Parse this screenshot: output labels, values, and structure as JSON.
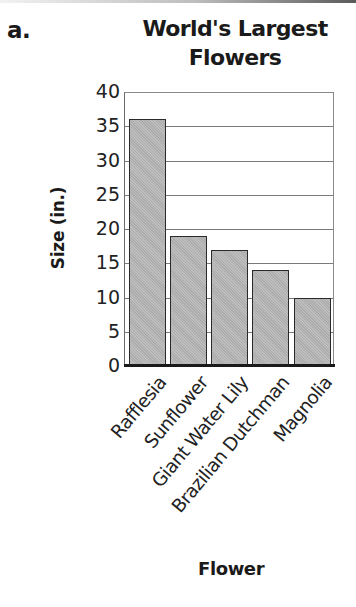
{
  "header": {
    "part_label": "a.",
    "title_line1": "World's Largest",
    "title_line2": "Flowers"
  },
  "axes": {
    "ylabel": "Size (in.)",
    "xlabel": "Flower",
    "yticks": [
      "0",
      "5",
      "10",
      "15",
      "20",
      "25",
      "30",
      "35",
      "40"
    ]
  },
  "colors": {
    "bar_fill": "#b5b5b5",
    "bar_border": "#2a2a2a",
    "gridline": "#7a7a7a",
    "text": "#1a1a1a"
  },
  "chart_data": {
    "type": "bar",
    "title": "World's Largest Flowers",
    "xlabel": "Flower",
    "ylabel": "Size (in.)",
    "categories": [
      "Rafflesia",
      "Sunflower",
      "Giant Water Lily",
      "Brazilian Dutchman",
      "Magnolia"
    ],
    "values": [
      36,
      19,
      17,
      14,
      10
    ],
    "ylim": [
      0,
      40
    ],
    "yticks": [
      0,
      5,
      10,
      15,
      20,
      25,
      30,
      35,
      40
    ],
    "grid": true,
    "legend": null,
    "xtick_rotation": -50
  }
}
